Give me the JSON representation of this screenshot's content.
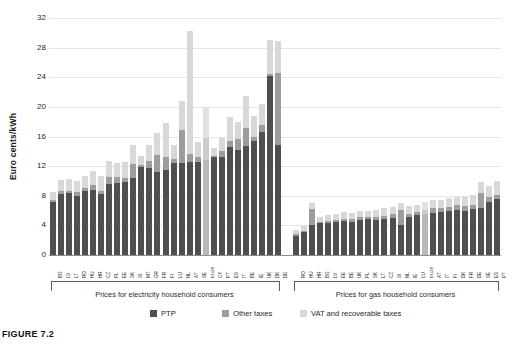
{
  "figure": {
    "caption": "FIGURE 7.2"
  },
  "axis": {
    "ylabel": "Euro cents/kWh",
    "yticks": [
      "0",
      "4",
      "8",
      "12",
      "16",
      "20",
      "24",
      "28",
      "32"
    ]
  },
  "groups": [
    {
      "id": "electricity",
      "label": "Prices for electricity household consumers"
    },
    {
      "id": "gas",
      "label": "Prices for gas household consumers"
    }
  ],
  "legend": [
    {
      "key": "ptp",
      "label": "PTP",
      "color": "#4f4f4f"
    },
    {
      "key": "other",
      "label": "Other taxes",
      "color": "#9d9d9d"
    },
    {
      "key": "vat",
      "label": "VAT and recoverable taxes",
      "color": "#d8d8d8"
    }
  ],
  "chart_data": {
    "type": "bar",
    "title": "",
    "subtitle": "",
    "xlabel": "",
    "ylabel": "Euro cents/kWh",
    "ylim": [
      0,
      32
    ],
    "ytick_step": 4,
    "grid": true,
    "stacked": true,
    "legend_position": "bottom",
    "series": [
      {
        "name": "PTP",
        "color": "#4f4f4f"
      },
      {
        "name": "Other taxes",
        "color": "#9d9d9d"
      },
      {
        "name": "VAT and recoverable taxes",
        "color": "#d8d8d8"
      }
    ],
    "panels": [
      {
        "name": "Prices for electricity household consumers",
        "categories": [
          "BG",
          "LV",
          "LT",
          "RO",
          "HU",
          "HR",
          "CZ",
          "PL",
          "EE",
          "SK",
          "SI",
          "MT",
          "GR",
          "FR",
          "FI",
          "LU",
          "NL",
          "AT",
          "SE",
          "EU28",
          "CY",
          "PT",
          "ES",
          "IT",
          "BE",
          "IE",
          "UK",
          "DK",
          "DE"
        ],
        "values": {
          "PTP": [
            7.1,
            8.3,
            8.4,
            8.0,
            8.6,
            8.8,
            8.2,
            9.6,
            9.7,
            9.9,
            10.4,
            11.9,
            11.7,
            11.2,
            11.5,
            12.4,
            12.4,
            12.5,
            12.5,
            12.8,
            13.2,
            13.3,
            14.6,
            14.2,
            14.7,
            15.4,
            16.6,
            24.2,
            14.8
          ],
          "Other taxes": [
            0.3,
            0.3,
            0.3,
            0.5,
            0.5,
            0.6,
            0.4,
            0.9,
            0.8,
            0.5,
            1.9,
            0.2,
            1.0,
            2.3,
            1.8,
            0.6,
            4.5,
            1.1,
            0.8,
            3.0,
            0.2,
            0.8,
            0.8,
            1.5,
            2.4,
            0.6,
            0.9,
            0.2,
            9.8
          ],
          "VAT and recoverable taxes": [
            1.1,
            1.5,
            1.6,
            1.5,
            1.6,
            1.9,
            2.1,
            2.2,
            1.9,
            2.2,
            2.5,
            1.3,
            2.2,
            3.0,
            4.5,
            1.9,
            3.9,
            16.6,
            2.0,
            4.2,
            1.0,
            1.7,
            3.2,
            2.2,
            4.4,
            2.8,
            2.9,
            4.6,
            4.3
          ]
        },
        "totals": [
          8.5,
          10.1,
          10.3,
          10.0,
          10.7,
          11.3,
          10.7,
          12.7,
          12.4,
          12.6,
          14.8,
          13.4,
          14.9,
          16.5,
          17.8,
          14.9,
          20.8,
          30.2,
          15.3,
          20.0,
          14.4,
          15.8,
          18.6,
          17.9,
          21.5,
          18.8,
          20.4,
          29.0,
          28.9
        ]
      },
      {
        "name": "Prices for gas household consumers",
        "categories": [
          "RO",
          "HU",
          "HR",
          "BG",
          "LV",
          "EE",
          "BE",
          "UK",
          "PL",
          "SK",
          "LT",
          "CZ",
          "SI",
          "NL",
          "IE",
          "LU",
          "EU28",
          "AT",
          "IT",
          "FI",
          "DK",
          "FR",
          "DE",
          "SE",
          "ES",
          "PT"
        ],
        "values": {
          "PTP": [
            2.6,
            3.1,
            4.0,
            4.3,
            4.3,
            4.4,
            4.6,
            4.4,
            4.7,
            4.8,
            4.7,
            4.9,
            5.0,
            4.1,
            5.2,
            5.4,
            5.5,
            5.7,
            5.8,
            6.0,
            6.1,
            6.0,
            6.2,
            6.4,
            7.2,
            7.5
          ],
          "Other taxes": [
            0.2,
            0.2,
            2.2,
            0.2,
            0.3,
            0.3,
            0.3,
            0.4,
            0.4,
            0.3,
            0.4,
            0.4,
            0.5,
            2.0,
            0.4,
            0.4,
            0.6,
            0.6,
            0.5,
            0.5,
            0.6,
            0.6,
            0.6,
            2.0,
            0.6,
            0.6
          ],
          "VAT and recoverable taxes": [
            0.6,
            0.6,
            0.8,
            0.7,
            0.8,
            0.8,
            0.9,
            0.9,
            0.9,
            0.9,
            1.0,
            1.0,
            1.0,
            0.9,
            1.0,
            1.0,
            1.1,
            1.1,
            1.1,
            1.2,
            1.2,
            1.2,
            1.3,
            1.5,
            1.5,
            1.9
          ]
        },
        "totals": [
          3.4,
          3.9,
          7.0,
          5.2,
          5.4,
          5.5,
          5.8,
          5.7,
          6.0,
          6.0,
          6.1,
          6.3,
          6.5,
          7.0,
          6.6,
          6.8,
          7.2,
          7.4,
          7.4,
          7.7,
          7.9,
          7.8,
          8.1,
          9.9,
          9.3,
          10.0
        ]
      }
    ]
  }
}
